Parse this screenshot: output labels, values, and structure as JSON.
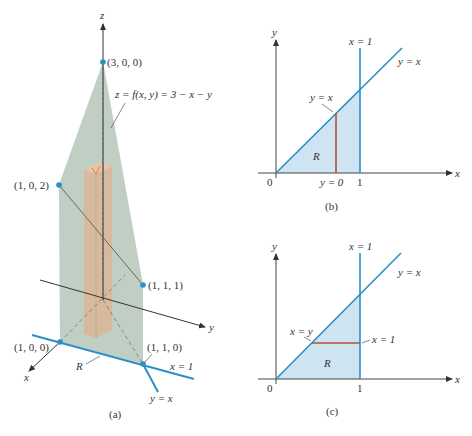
{
  "colors": {
    "blue_line": "#2a8fc8",
    "region_fill": "#cfe4f2",
    "red_line": "#b5503a",
    "axis": "#333333",
    "surface_fill": "#a9bcae",
    "column_fill": "#d9b89a",
    "point": "#2a8fc8"
  },
  "panel_a": {
    "caption": "(a)",
    "axis_z": "z",
    "axis_x": "x",
    "axis_y": "y",
    "surface_label": "z = f(x, y) = 3 − x − y",
    "points": [
      {
        "label": "(3, 0, 0)"
      },
      {
        "label": "(1, 0, 2)"
      },
      {
        "label": "(1, 1, 1)"
      },
      {
        "label": "(1, 0, 0)"
      },
      {
        "label": "(1, 1, 0)"
      }
    ],
    "region_label": "R",
    "line_x1_label": "x = 1",
    "line_yx_label": "y = x"
  },
  "panel_b": {
    "caption": "(b)",
    "axis_x": "x",
    "axis_y": "y",
    "origin": "0",
    "tick_1": "1",
    "vline_label": "x = 1",
    "diag_label": "y = x",
    "cut_top_label": "y = x",
    "cut_bottom_label": "y = 0",
    "region_label": "R"
  },
  "panel_c": {
    "caption": "(c)",
    "axis_x": "x",
    "axis_y": "y",
    "origin": "0",
    "tick_1": "1",
    "vline_label": "x = 1",
    "diag_label": "y = x",
    "cut_left_label": "x = y",
    "cut_right_label": "x = 1",
    "region_label": "R"
  }
}
